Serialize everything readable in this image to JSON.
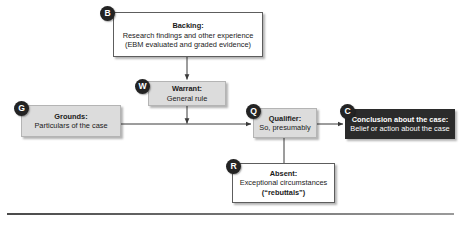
{
  "diagram": {
    "type": "toulmin-argument-model",
    "nodes": [
      {
        "id": "backing",
        "badge": "B",
        "title": "Backing:",
        "lines": [
          "Research findings and other experience",
          "(EBM evaluated and graded evidence)"
        ],
        "style": "plain",
        "fill": "#ffffff",
        "text_color": "#1a1a1a"
      },
      {
        "id": "warrant",
        "badge": "W",
        "title": "Warrant:",
        "lines": [
          "General rule"
        ],
        "style": "shaded",
        "fill": "#dcdcdc",
        "text_color": "#1a1a1a"
      },
      {
        "id": "grounds",
        "badge": "G",
        "title": "Grounds:",
        "lines": [
          "Particulars of the case"
        ],
        "style": "shaded",
        "fill": "#dcdcdc",
        "text_color": "#1a1a1a"
      },
      {
        "id": "qualifier",
        "badge": "Q",
        "title": "Qualifier:",
        "lines": [
          "So, presumably"
        ],
        "style": "shaded",
        "fill": "#dcdcdc",
        "text_color": "#1a1a1a"
      },
      {
        "id": "conclusion",
        "badge": "C",
        "title": "Conclusion about the case:",
        "lines": [
          "Belief or action about the case"
        ],
        "style": "dark",
        "fill": "#2b2b2b",
        "text_color": "#ffffff"
      },
      {
        "id": "absent",
        "badge": "R",
        "title": "Absent:",
        "lines": [
          "Exceptional circumstances",
          "(“rebuttals”)"
        ],
        "style": "plain",
        "fill": "#ffffff",
        "text_color": "#1a1a1a"
      }
    ],
    "connectors": [
      {
        "id": "backing-to-warrant",
        "from": "backing",
        "to": "warrant",
        "arrowhead": true
      },
      {
        "id": "grounds-to-qualifier",
        "from": "grounds",
        "to": "qualifier",
        "arrowhead": true
      },
      {
        "id": "warrant-to-inference",
        "from": "warrant",
        "to": "grounds-to-qualifier",
        "arrowhead": true
      },
      {
        "id": "qualifier-to-conclusion",
        "from": "qualifier",
        "to": "conclusion",
        "arrowhead": true
      },
      {
        "id": "absent-to-qualifier",
        "from": "absent",
        "to": "qualifier",
        "arrowhead": false
      }
    ],
    "line_color": "#3a3a3a",
    "rule_color": "#4a4a4a"
  }
}
